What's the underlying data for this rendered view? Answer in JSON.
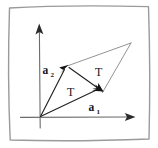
{
  "figure": {
    "background_color": "#ffffff",
    "frame": {
      "name": "hand-drawn border",
      "color": "#9a9a9a"
    },
    "axes": {
      "x_axis_label": "",
      "y_axis_label": "",
      "color": "#6b6b6b",
      "origin": {
        "x": 40,
        "y": 117
      }
    },
    "vectors": [
      {
        "id": "a1",
        "label_base": "a",
        "label_sub": "1",
        "label_text": "a₁",
        "from": {
          "x": 40,
          "y": 117
        },
        "to": {
          "x": 102,
          "y": 92
        },
        "color": "#232323"
      },
      {
        "id": "a2",
        "label_base": "a",
        "label_sub": "2",
        "label_text": "a₂",
        "from": {
          "x": 40,
          "y": 117
        },
        "to": {
          "x": 68,
          "y": 66
        },
        "color": "#232323"
      },
      {
        "id": "diagonal",
        "label_base": "",
        "label_sub": "",
        "label_text": "",
        "from": {
          "x": 68,
          "y": 66
        },
        "to": {
          "x": 102,
          "y": 92
        },
        "color": "#232323"
      }
    ],
    "apex": {
      "x": 131,
      "y": 43
    },
    "region_labels": [
      {
        "id": "T-lower",
        "text": "T",
        "x": 70,
        "y": 95
      },
      {
        "id": "T-upper",
        "text": "T",
        "x": 98,
        "y": 74
      }
    ],
    "colors": {
      "ink": "#161616",
      "axis": "#6b6b6b",
      "frame": "#9a9a9a",
      "edge": "#8d8d8d",
      "background": "#ffffff"
    }
  }
}
